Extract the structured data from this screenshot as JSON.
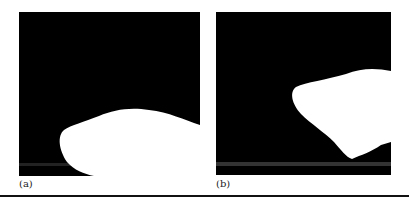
{
  "figure": {
    "panels": [
      {
        "label": "(a)",
        "description": "Binary segmentation mask: white region in lower portion against black background"
      },
      {
        "label": "(b)",
        "description": "Binary segmentation mask: white region on right side against black background"
      }
    ],
    "colors": {
      "background": "#000000",
      "foreground": "#ffffff"
    }
  }
}
